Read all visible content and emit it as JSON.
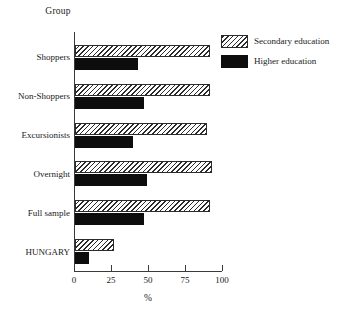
{
  "chart_data": {
    "type": "bar",
    "orientation": "horizontal",
    "title": "",
    "xlabel": "%",
    "ylabel": "Group",
    "xlim": [
      0,
      100
    ],
    "xticks": [
      0,
      25,
      50,
      75,
      100
    ],
    "xtick_labels": [
      "0",
      "25",
      "50",
      "75",
      "100"
    ],
    "grid": false,
    "legend_position": "top-right",
    "categories": [
      "Shoppers",
      "Non-Shoppers",
      "Excursionists",
      "Overnight",
      "Full sample",
      "HUNGARY"
    ],
    "series": [
      {
        "name": "Secondary education",
        "pattern": "hatched",
        "color": "#ffffff",
        "edge_color": "#2b2b2b",
        "values": [
          92,
          92,
          90,
          93,
          92,
          27
        ]
      },
      {
        "name": "Higher education",
        "pattern": "solid",
        "color": "#0d0d0d",
        "edge_color": "#0d0d0d",
        "values": [
          43,
          47,
          40,
          49,
          47,
          10
        ]
      }
    ]
  },
  "legend": {
    "items": [
      {
        "label": "Secondary education",
        "swatch": "hatch-swatch"
      },
      {
        "label": "Higher education",
        "swatch": "solid-swatch"
      }
    ]
  },
  "axes": {
    "y_axis_title": "Group",
    "x_axis_title": "%"
  }
}
